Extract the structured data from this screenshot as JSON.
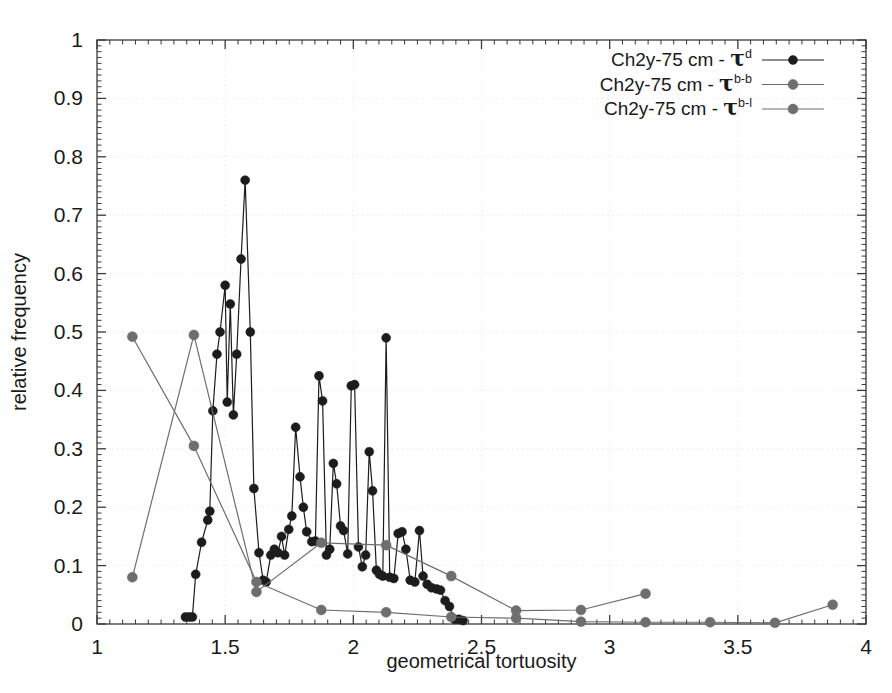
{
  "chart_data": {
    "type": "line",
    "title": "",
    "xlabel": "geometrical tortuosity",
    "ylabel": "relative frequency",
    "xlim": [
      1,
      4
    ],
    "ylim": [
      0,
      1
    ],
    "xticks": [
      "1",
      "1.5",
      "2",
      "2.5",
      "3",
      "3.5",
      "4"
    ],
    "xtick_values": [
      1,
      1.5,
      2,
      2.5,
      3,
      3.5,
      4
    ],
    "yticks": [
      "0",
      "0.1",
      "0.2",
      "0.3",
      "0.4",
      "0.5",
      "0.6",
      "0.7",
      "0.8",
      "0.9",
      "1"
    ],
    "ytick_values": [
      0,
      0.1,
      0.2,
      0.3,
      0.4,
      0.5,
      0.6,
      0.7,
      0.8,
      0.9,
      1
    ],
    "grid": true,
    "grid_style": "dotted",
    "legend_position": "top-right",
    "minor_ticks_per_major": 10,
    "series": [
      {
        "name": "Ch2y-75 cm - τd",
        "label_base": "Ch2y-75 cm - τ",
        "label_sup": "d",
        "color": "#1c1c1c",
        "marker": "circle",
        "marker_size": 9,
        "points": [
          [
            1.345,
            0.012
          ],
          [
            1.36,
            0.012
          ],
          [
            1.372,
            0.012
          ],
          [
            1.385,
            0.085
          ],
          [
            1.408,
            0.14
          ],
          [
            1.432,
            0.178
          ],
          [
            1.44,
            0.193
          ],
          [
            1.452,
            0.365
          ],
          [
            1.468,
            0.462
          ],
          [
            1.48,
            0.5
          ],
          [
            1.5,
            0.58
          ],
          [
            1.508,
            0.38
          ],
          [
            1.52,
            0.548
          ],
          [
            1.532,
            0.358
          ],
          [
            1.545,
            0.462
          ],
          [
            1.562,
            0.625
          ],
          [
            1.578,
            0.76
          ],
          [
            1.598,
            0.5
          ],
          [
            1.612,
            0.232
          ],
          [
            1.632,
            0.122
          ],
          [
            1.648,
            0.075
          ],
          [
            1.66,
            0.072
          ],
          [
            1.678,
            0.118
          ],
          [
            1.692,
            0.128
          ],
          [
            1.706,
            0.122
          ],
          [
            1.72,
            0.15
          ],
          [
            1.732,
            0.118
          ],
          [
            1.748,
            0.162
          ],
          [
            1.76,
            0.185
          ],
          [
            1.775,
            0.337
          ],
          [
            1.792,
            0.252
          ],
          [
            1.805,
            0.2
          ],
          [
            1.818,
            0.158
          ],
          [
            1.838,
            0.141
          ],
          [
            1.852,
            0.142
          ],
          [
            1.866,
            0.425
          ],
          [
            1.88,
            0.382
          ],
          [
            1.895,
            0.118
          ],
          [
            1.908,
            0.128
          ],
          [
            1.922,
            0.275
          ],
          [
            1.935,
            0.24
          ],
          [
            1.95,
            0.168
          ],
          [
            1.962,
            0.16
          ],
          [
            1.978,
            0.12
          ],
          [
            1.992,
            0.408
          ],
          [
            2.005,
            0.41
          ],
          [
            2.02,
            0.132
          ],
          [
            2.035,
            0.098
          ],
          [
            2.048,
            0.118
          ],
          [
            2.062,
            0.295
          ],
          [
            2.075,
            0.228
          ],
          [
            2.09,
            0.092
          ],
          [
            2.102,
            0.085
          ],
          [
            2.115,
            0.082
          ],
          [
            2.128,
            0.49
          ],
          [
            2.142,
            0.08
          ],
          [
            2.158,
            0.078
          ],
          [
            2.175,
            0.155
          ],
          [
            2.19,
            0.158
          ],
          [
            2.205,
            0.128
          ],
          [
            2.222,
            0.075
          ],
          [
            2.24,
            0.072
          ],
          [
            2.258,
            0.16
          ],
          [
            2.272,
            0.082
          ],
          [
            2.288,
            0.068
          ],
          [
            2.305,
            0.062
          ],
          [
            2.325,
            0.06
          ],
          [
            2.34,
            0.058
          ],
          [
            2.358,
            0.04
          ],
          [
            2.375,
            0.03
          ],
          [
            2.395,
            0.008
          ],
          [
            2.412,
            0.008
          ],
          [
            2.428,
            0.006
          ]
        ]
      },
      {
        "name": "Ch2y-75 cm - τb-b",
        "label_base": "Ch2y-75 cm - τ",
        "label_sup": "b-b",
        "color": "#6e6e6e",
        "marker": "circle",
        "marker_size": 10,
        "points": [
          [
            1.138,
            0.492
          ],
          [
            1.378,
            0.305
          ],
          [
            1.622,
            0.072
          ],
          [
            1.875,
            0.024
          ],
          [
            2.128,
            0.02
          ],
          [
            2.382,
            0.012
          ],
          [
            2.635,
            0.01
          ],
          [
            2.888,
            0.004
          ],
          [
            3.14,
            0.003
          ],
          [
            3.392,
            0.003
          ],
          [
            3.645,
            0.002
          ],
          [
            3.87,
            0.033
          ]
        ]
      },
      {
        "name": "Ch2y-75 cm - τb-l",
        "label_base": "Ch2y-75 cm - τ",
        "label_sup": "b-l",
        "color": "#6e6e6e",
        "marker": "circle",
        "marker_size": 10,
        "points": [
          [
            1.138,
            0.08
          ],
          [
            1.378,
            0.495
          ],
          [
            1.622,
            0.055
          ],
          [
            1.875,
            0.139
          ],
          [
            2.128,
            0.135
          ],
          [
            2.382,
            0.082
          ],
          [
            2.635,
            0.023
          ],
          [
            2.888,
            0.024
          ],
          [
            3.14,
            0.052
          ]
        ]
      }
    ]
  },
  "legend": {
    "entries": [
      {
        "base": "Ch2y-75 cm - τ",
        "sup": "d"
      },
      {
        "base": "Ch2y-75 cm - τ",
        "sup": "b-b"
      },
      {
        "base": "Ch2y-75 cm - τ",
        "sup": "b-l"
      }
    ]
  },
  "axes": {
    "x_title": "geometrical tortuosity",
    "y_title": "relative frequency"
  },
  "colors": {
    "series_dark": "#1c1c1c",
    "series_gray": "#6e6e6e",
    "frame": "#3a3a3a",
    "grid": "#e9e9e9",
    "background": "#ffffff"
  }
}
